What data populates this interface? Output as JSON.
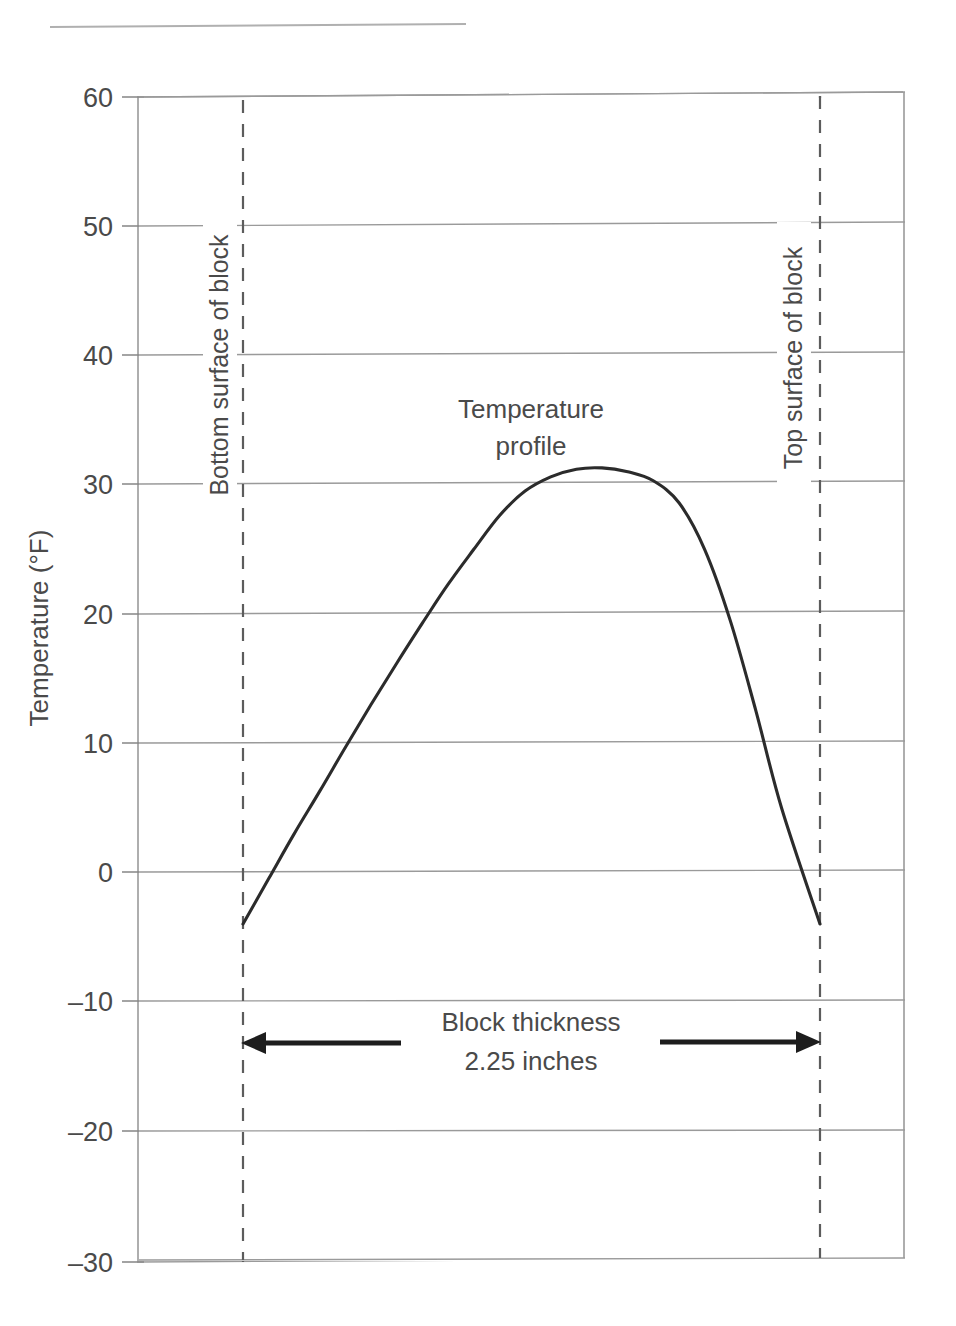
{
  "chart_data": {
    "type": "line",
    "title": "",
    "xlabel": "",
    "ylabel": "Temperature (°F)",
    "ylim": [
      -30,
      60
    ],
    "yticks": [
      60,
      50,
      40,
      30,
      20,
      10,
      0,
      -10,
      -20,
      -30
    ],
    "ytick_labels": [
      "60",
      "50",
      "40",
      "30",
      "20",
      "10",
      "0",
      "–10",
      "–20",
      "–30"
    ],
    "grid": true,
    "legend": "none",
    "x_axis_shown": false,
    "series": [
      {
        "name": "Temperature profile",
        "x_meaning": "position through block thickness (inches, 0 = bottom surface, 2.25 = top surface)",
        "points": [
          {
            "x": 0.0,
            "y": -4.0
          },
          {
            "x": 0.1,
            "y": -0.5
          },
          {
            "x": 0.2,
            "y": 3.0
          },
          {
            "x": 0.3,
            "y": 6.3
          },
          {
            "x": 0.4,
            "y": 9.7
          },
          {
            "x": 0.5,
            "y": 13.0
          },
          {
            "x": 0.6,
            "y": 16.2
          },
          {
            "x": 0.7,
            "y": 19.3
          },
          {
            "x": 0.8,
            "y": 22.3
          },
          {
            "x": 0.9,
            "y": 25.0
          },
          {
            "x": 1.0,
            "y": 27.6
          },
          {
            "x": 1.1,
            "y": 29.5
          },
          {
            "x": 1.2,
            "y": 30.6
          },
          {
            "x": 1.3,
            "y": 31.2
          },
          {
            "x": 1.4,
            "y": 31.3
          },
          {
            "x": 1.5,
            "y": 31.0
          },
          {
            "x": 1.6,
            "y": 30.3
          },
          {
            "x": 1.7,
            "y": 28.6
          },
          {
            "x": 1.8,
            "y": 25.0
          },
          {
            "x": 1.9,
            "y": 19.5
          },
          {
            "x": 2.0,
            "y": 12.5
          },
          {
            "x": 2.1,
            "y": 5.0
          },
          {
            "x": 2.25,
            "y": -4.0
          }
        ],
        "peak_value": 31.3,
        "left_surface_value": -4.0,
        "right_surface_value": -4.0
      }
    ],
    "annotations": [
      {
        "name": "curve-label",
        "text": "Temperature profile",
        "lines": [
          "Temperature",
          "profile"
        ]
      },
      {
        "name": "left-surface-marker",
        "text": "Bottom surface of block",
        "orientation": "vertical",
        "at_x": 0.0
      },
      {
        "name": "right-surface-marker",
        "text": "Top surface of block",
        "orientation": "vertical",
        "at_x": 2.25
      },
      {
        "name": "thickness-dimension",
        "lines": [
          "Block thickness",
          "2.25 inches"
        ],
        "value": 2.25,
        "unit": "inches",
        "at_y": -15
      }
    ]
  },
  "labels": {
    "y_axis_title": "Temperature (°F)",
    "ticks": {
      "t60": "60",
      "t50": "50",
      "t40": "40",
      "t30": "30",
      "t20": "20",
      "t10": "10",
      "t0": "0",
      "tm10": "–10",
      "tm20": "–20",
      "tm30": "–30"
    },
    "left_marker": "Bottom surface of block",
    "right_marker": "Top surface of block",
    "curve_label_line1": "Temperature",
    "curve_label_line2": "profile",
    "dimension_line1": "Block thickness",
    "dimension_line2": "2.25 inches"
  },
  "colors": {
    "curve": "#2b2b2b",
    "gridline": "#9a9a9a",
    "dashed_marker": "#5c5c5c",
    "arrow": "#1d1d1d",
    "text": "#4a4a4a",
    "background": "#ffffff"
  }
}
